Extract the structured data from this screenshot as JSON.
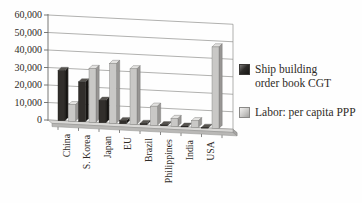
{
  "chart_data": {
    "type": "bar",
    "projection": "3d-column",
    "title": "",
    "categories": [
      "China",
      "S. Korea",
      "Japan",
      "EU",
      "Brazil",
      "Philippines",
      "India",
      "USA"
    ],
    "series": [
      {
        "name": "Ship building order book CGT",
        "legend_lines": [
          "Ship building",
          "order book CGT"
        ],
        "color_front": "#312e2b",
        "color_side": "#161412",
        "color_top": "#56534f",
        "values": [
          29000,
          23000,
          13000,
          1800,
          800,
          600,
          400,
          300
        ]
      },
      {
        "name": "Labor: per capita PPP",
        "legend_lines": [
          "Labor: per capita PPP"
        ],
        "color_front": "#c9c8c6",
        "color_side": "#989694",
        "color_top": "#e3e2e0",
        "values": [
          9500,
          31000,
          34500,
          32000,
          11000,
          4500,
          3800,
          47000
        ]
      }
    ],
    "y_axis": {
      "min": 0,
      "max": 60000,
      "step": 10000,
      "tick_labels": [
        "0",
        "10,000",
        "20,000",
        "30,000",
        "40,000",
        "50,000",
        "60,000"
      ]
    },
    "grid": true,
    "legend_position": "right",
    "colors": {
      "gridline": "#8f8f8d",
      "axis": "#6a6a68",
      "floor_top": "#d9d8d6",
      "floor_front": "#b9b8b6",
      "floor_side": "#a5a4a2",
      "text": "#2f2b27"
    }
  }
}
